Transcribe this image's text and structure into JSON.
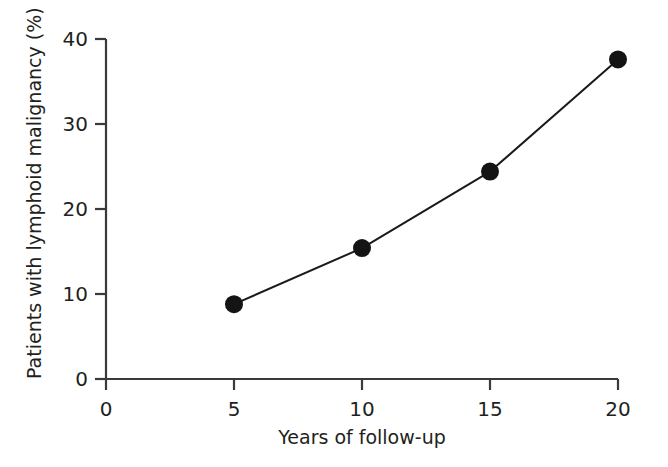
{
  "chart_data": {
    "type": "line",
    "title": "",
    "subtitle": "",
    "xlabel": "Years of follow-up",
    "ylabel": "Patients with lymphoid malignancy (%)",
    "x": [
      5,
      10,
      15,
      20
    ],
    "values": [
      8.8,
      15.4,
      24.4,
      37.6
    ],
    "series": [
      {
        "name": "Cumulative incidence of lymphoid malignancy",
        "x": [
          5,
          10,
          15,
          20
        ],
        "values": [
          8.8,
          15.4,
          24.4,
          37.6
        ]
      }
    ],
    "xlim": [
      0,
      20
    ],
    "ylim": [
      0,
      40
    ],
    "xticks": [
      0,
      5,
      10,
      15,
      20
    ],
    "yticks": [
      0,
      10,
      20,
      30,
      40
    ],
    "xtick_labels": [
      "0",
      "5",
      "10",
      "15",
      "20"
    ],
    "ytick_labels": [
      "0",
      "10",
      "20",
      "30",
      "40"
    ],
    "grid": false,
    "legend": false,
    "legend_position": "none",
    "marker": "filled-circle",
    "marker_color": "#141414",
    "line_color": "#1a1a1a",
    "axis_color": "#3a3a3a",
    "text_color": "#231f20",
    "background": "#ffffff",
    "annotations": []
  },
  "axes": {
    "y_tick_labels": [
      "40",
      "30",
      "20",
      "10",
      "0"
    ],
    "x_tick_labels": [
      "0",
      "5",
      "10",
      "15",
      "20"
    ],
    "y_title": "Patients with lymphoid malignancy (%)",
    "x_title": "Years of follow-up"
  }
}
